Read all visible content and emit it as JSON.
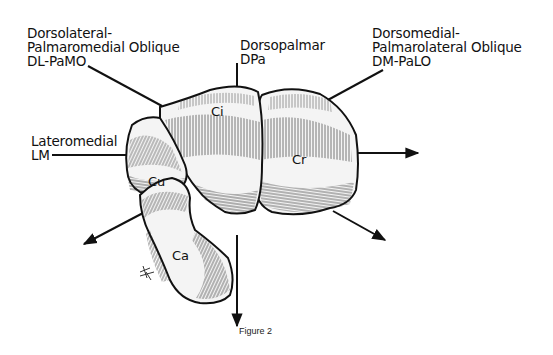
{
  "projections": [
    {
      "id": "dlpamo",
      "name_line1": "Dorsolateral-",
      "name_line2": "Palmaromedial Oblique",
      "abbr": "DL-PaMO"
    },
    {
      "id": "dpa",
      "name_line1": "Dorsopalmar",
      "abbr": "DPa"
    },
    {
      "id": "dmpalo",
      "name_line1": "Dorsomedial-",
      "name_line2": "Palmarolateral Oblique",
      "abbr": "DM-PaLO"
    },
    {
      "id": "lm",
      "name_line1": "Lateromedial",
      "abbr": "LM"
    }
  ],
  "bones": {
    "ci": "Ci",
    "cu": "Cu",
    "cr": "Cr",
    "ca": "Ca"
  },
  "artist_mark": "MK",
  "caption": "Figure 2",
  "colors": {
    "ink": "#111111",
    "background": "#ffffff",
    "bone_fill": "#f4f4f4"
  }
}
